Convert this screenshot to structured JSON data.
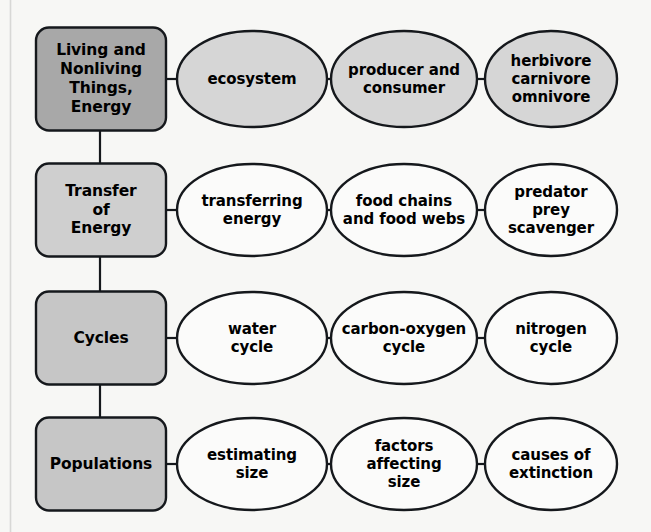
{
  "diagram": {
    "type": "concept-map",
    "background_color": "#f7f7f5",
    "line_color": "#15181c",
    "text_color": "#000000",
    "left_edge_rule_color": "#d8d8d6",
    "rows": [
      {
        "id": "row-1",
        "topic": {
          "label": "Living and\nNonliving\nThings,\nEnergy",
          "fill": "#a8a8a8"
        },
        "nodes": [
          {
            "label": "ecosystem",
            "fill": "#d6d6d6"
          },
          {
            "label": "producer and\nconsumer",
            "fill": "#d6d6d6"
          },
          {
            "label": "herbivore\ncarnivore\nomnivore",
            "fill": "#d6d6d6"
          }
        ]
      },
      {
        "id": "row-2",
        "topic": {
          "label": "Transfer\nof\nEnergy",
          "fill": "#cfcfcf"
        },
        "nodes": [
          {
            "label": "transferring\nenergy",
            "fill": "#fbfbfa"
          },
          {
            "label": "food chains\nand food webs",
            "fill": "#fbfbfa"
          },
          {
            "label": "predator\nprey\nscavenger",
            "fill": "#fbfbfa"
          }
        ]
      },
      {
        "id": "row-3",
        "topic": {
          "label": "Cycles",
          "fill": "#c6c6c6"
        },
        "nodes": [
          {
            "label": "water\ncycle",
            "fill": "#fbfbfa"
          },
          {
            "label": "carbon-oxygen\ncycle",
            "fill": "#fbfbfa"
          },
          {
            "label": "nitrogen\ncycle",
            "fill": "#fbfbfa"
          }
        ]
      },
      {
        "id": "row-4",
        "topic": {
          "label": "Populations",
          "fill": "#c6c6c6"
        },
        "nodes": [
          {
            "label": "estimating\nsize",
            "fill": "#fbfbfa"
          },
          {
            "label": "factors\naffecting\nsize",
            "fill": "#fbfbfa"
          },
          {
            "label": "causes of\nextinction",
            "fill": "#fbfbfa"
          }
        ]
      }
    ]
  }
}
